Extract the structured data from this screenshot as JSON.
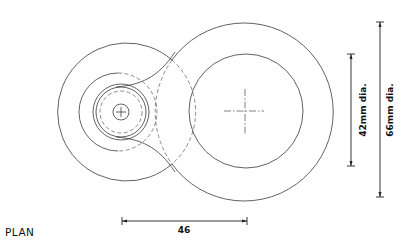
{
  "drawing": {
    "view_label": "PLAN",
    "dimensions": {
      "center_distance": "46",
      "inner_diameter": "42mm dia.",
      "outer_diameter": "66mm dia."
    }
  },
  "colors": {
    "background": "#ffffff",
    "line": "#3a3a3a"
  }
}
